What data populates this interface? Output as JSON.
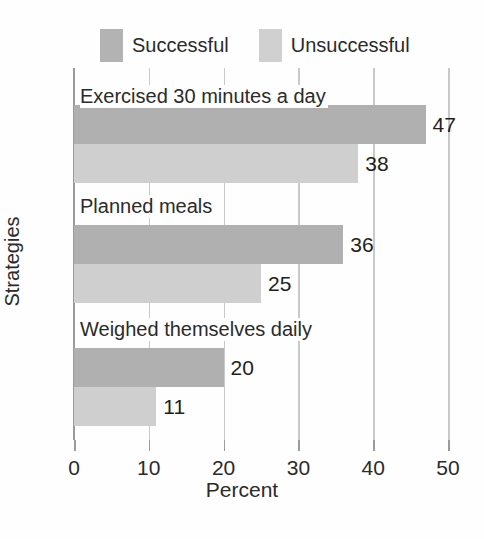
{
  "chart_data": {
    "type": "bar",
    "orientation": "horizontal",
    "title": "",
    "xlabel": "Percent",
    "ylabel": "Strategies",
    "xlim": [
      0,
      50
    ],
    "xticks": [
      0,
      10,
      20,
      30,
      40,
      50
    ],
    "xticklabels": [
      "0",
      "10",
      "20",
      "30",
      "40",
      "50"
    ],
    "grid": true,
    "grid_axis": "x",
    "legend_position": "top-left",
    "categories": [
      "Exercised 30 minutes a day",
      "Planned meals",
      "Weighed themselves daily"
    ],
    "series": [
      {
        "name": "Successful",
        "color": "#b0b0b0",
        "values": [
          47,
          36,
          20
        ],
        "value_labels": [
          "47",
          "36",
          "20"
        ]
      },
      {
        "name": "Unsuccessful",
        "color": "#cfcfcf",
        "values": [
          38,
          25,
          11
        ],
        "value_labels": [
          "38",
          "25",
          "11"
        ]
      }
    ]
  },
  "legend": {
    "entries": [
      {
        "label": "Successful",
        "swatch": "successful-swatch"
      },
      {
        "label": "Unsuccessful",
        "swatch": "unsuccessful-swatch"
      }
    ]
  },
  "axes": {
    "x_title": "Percent",
    "y_title": "Strategies"
  }
}
